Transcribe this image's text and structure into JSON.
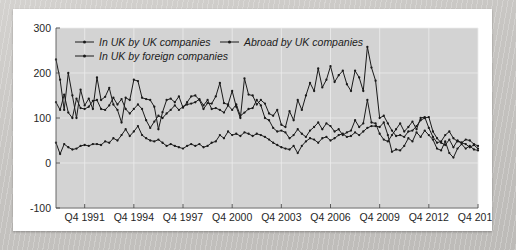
{
  "chart_data": {
    "type": "line",
    "title": "",
    "subtitle": "",
    "xlabel": "",
    "ylabel": "",
    "ylim": [
      -100,
      300
    ],
    "yticks": [
      -100,
      0,
      100,
      200,
      300
    ],
    "ytick_labels": [
      "-100",
      "0",
      "100",
      "200",
      "300"
    ],
    "xtick_labels": [
      "Q4 1991",
      "Q4 1994",
      "Q4 1997",
      "Q4 2000",
      "Q4 2003",
      "Q4 2006",
      "Q4 2009",
      "Q4 2012",
      "Q4 2015"
    ],
    "xtick_indices": [
      7,
      19,
      31,
      43,
      55,
      67,
      79,
      91,
      103
    ],
    "x_start_label": "Q1 1990",
    "x_end_label": "Q4 2015",
    "grid": true,
    "legend_position": "top-left-inside",
    "marker": "filled-circle",
    "series": [
      {
        "name": "In UK by UK companies",
        "values": [
          230,
          185,
          118,
          200,
          150,
          100,
          163,
          128,
          143,
          120,
          190,
          140,
          147,
          167,
          130,
          118,
          90,
          145,
          140,
          185,
          182,
          145,
          142,
          140,
          125,
          75,
          113,
          140,
          143,
          135,
          148,
          123,
          135,
          148,
          150,
          140,
          120,
          133,
          132,
          148,
          178,
          133,
          130,
          160,
          125,
          100,
          188,
          152,
          150,
          130,
          140,
          132,
          110,
          105,
          118,
          85,
          80,
          115,
          95,
          140,
          118,
          150,
          178,
          160,
          210,
          168,
          185,
          215,
          180,
          195,
          205,
          175,
          160,
          205,
          190,
          160,
          258,
          212,
          183,
          100,
          105,
          88,
          72,
          60,
          62,
          58,
          70,
          72,
          82,
          95,
          100,
          102,
          70,
          55,
          45,
          40,
          52,
          35,
          50,
          45,
          42,
          35,
          40,
          32
        ]
      },
      {
        "name": "Abroad by UK companies",
        "values": [
          135,
          118,
          152,
          112,
          100,
          143,
          122,
          120,
          125,
          138,
          140,
          120,
          118,
          128,
          145,
          130,
          142,
          120,
          110,
          120,
          130,
          120,
          95,
          78,
          92,
          105,
          100,
          110,
          118,
          128,
          118,
          125,
          130,
          132,
          135,
          142,
          128,
          140,
          120,
          122,
          118,
          112,
          128,
          118,
          130,
          105,
          112,
          120,
          122,
          140,
          128,
          100,
          95,
          78,
          70,
          72,
          68,
          55,
          62,
          75,
          65,
          58,
          72,
          80,
          90,
          75,
          88,
          82,
          70,
          75,
          62,
          68,
          72,
          95,
          80,
          88,
          140,
          90,
          88,
          65,
          52,
          48,
          62,
          75,
          88,
          70,
          80,
          92,
          75,
          100,
          102,
          78,
          58,
          45,
          48,
          62,
          70,
          55,
          48,
          45,
          52,
          50,
          42,
          38
        ]
      },
      {
        "name": "In UK by foreign companies",
        "values": [
          45,
          20,
          42,
          35,
          30,
          32,
          38,
          40,
          38,
          42,
          42,
          40,
          48,
          45,
          55,
          50,
          62,
          75,
          60,
          70,
          82,
          62,
          55,
          50,
          48,
          52,
          45,
          38,
          42,
          38,
          35,
          32,
          38,
          42,
          38,
          42,
          35,
          38,
          45,
          48,
          62,
          55,
          70,
          62,
          65,
          60,
          68,
          65,
          60,
          65,
          62,
          58,
          52,
          45,
          40,
          35,
          32,
          30,
          38,
          22,
          38,
          48,
          55,
          52,
          45,
          55,
          58,
          50,
          55,
          62,
          65,
          58,
          60,
          68,
          62,
          70,
          78,
          82,
          82,
          80,
          90,
          62,
          25,
          30,
          28,
          38,
          55,
          48,
          68,
          58,
          72,
          62,
          52,
          32,
          28,
          48,
          22,
          12,
          32,
          42,
          32,
          38,
          30,
          28
        ]
      }
    ]
  },
  "legend": {
    "items": [
      {
        "label": "In UK by UK companies"
      },
      {
        "label": "Abroad by UK companies"
      },
      {
        "label": "In UK by foreign companies"
      }
    ]
  },
  "colors": {
    "plot_background": "#d3d3d3",
    "card_background": "#ffffff",
    "page_background": "#c9c9c9",
    "series_stroke": "#1a1a1a",
    "gridline": "#ececec",
    "axis": "#5a5a5a",
    "text": "#262626"
  }
}
